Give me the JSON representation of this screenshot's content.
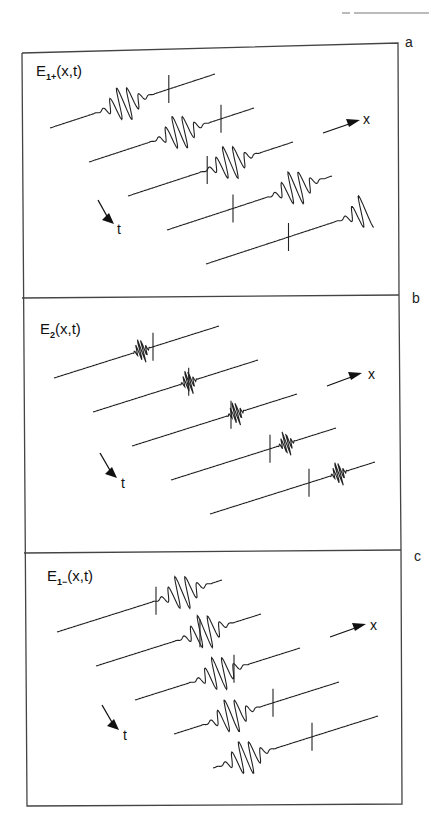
{
  "figure": {
    "panels": [
      {
        "id": "a",
        "label": "a",
        "title_main": "E",
        "title_sub": "1+",
        "title_args": "(x,t)",
        "x_axis_label": "x",
        "t_axis_label": "t",
        "packet_width": "wide",
        "traces": [
          {
            "marker_pos": 0.72,
            "packet_pos": 0.45
          },
          {
            "marker_pos": 0.8,
            "packet_pos": 0.55
          },
          {
            "marker_pos": 0.48,
            "packet_pos": 0.62
          },
          {
            "marker_pos": 0.4,
            "packet_pos": 0.78
          },
          {
            "marker_pos": 0.5,
            "packet_pos": 0.98
          }
        ]
      },
      {
        "id": "b",
        "label": "b",
        "title_main": "E",
        "title_sub": "2",
        "title_args": "(x,t)",
        "x_axis_label": "x",
        "t_axis_label": "t",
        "packet_width": "narrow",
        "traces": [
          {
            "marker_pos": 0.6,
            "packet_pos": 0.53
          },
          {
            "marker_pos": 0.58,
            "packet_pos": 0.58
          },
          {
            "marker_pos": 0.6,
            "packet_pos": 0.63
          },
          {
            "marker_pos": 0.6,
            "packet_pos": 0.7
          },
          {
            "marker_pos": 0.6,
            "packet_pos": 0.78
          }
        ]
      },
      {
        "id": "c",
        "label": "c",
        "title_main": "E",
        "title_sub": "1−",
        "title_args": "(x,t)",
        "x_axis_label": "x",
        "t_axis_label": "t",
        "packet_width": "wide",
        "traces": [
          {
            "marker_pos": 0.6,
            "packet_pos": 0.76
          },
          {
            "marker_pos": 0.63,
            "packet_pos": 0.66
          },
          {
            "marker_pos": 0.6,
            "packet_pos": 0.51
          },
          {
            "marker_pos": 0.6,
            "packet_pos": 0.35
          },
          {
            "marker_pos": 0.6,
            "packet_pos": 0.2
          }
        ]
      }
    ]
  }
}
